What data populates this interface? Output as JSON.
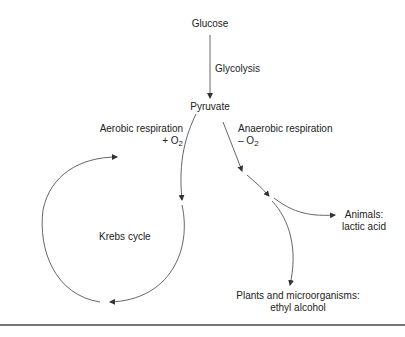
{
  "diagram": {
    "type": "flow",
    "nodes": {
      "glucose": "Glucose",
      "pyruvate": "Pyruvate",
      "krebs": "Krebs cycle",
      "animals_line1": "Animals:",
      "animals_line2": "lactic acid",
      "plants_line1": "Plants and microorganisms:",
      "plants_line2": "ethyl alcohol"
    },
    "edges": {
      "glycolysis": "Glycolysis",
      "aerobic_line1": "Aerobic respiration",
      "aerobic_sign": "+ O",
      "aerobic_sub": "2",
      "anaerobic_line1": "Anaerobic respiration",
      "anaerobic_sign": "– O",
      "anaerobic_sub": "2"
    },
    "colors": {
      "line": "#555555",
      "text": "#222222"
    }
  }
}
